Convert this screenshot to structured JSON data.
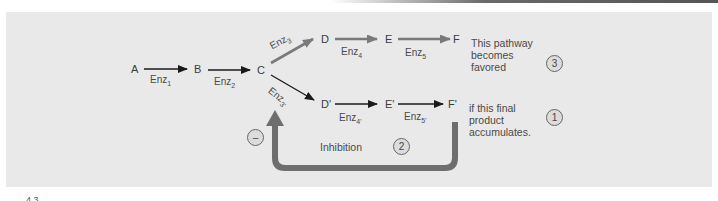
{
  "figure": {
    "caption_fragment": "4.3",
    "main_pathway": {
      "nodes": [
        "A",
        "B",
        "C"
      ],
      "enzymes": [
        {
          "label": "Enz",
          "sub": "1"
        },
        {
          "label": "Enz",
          "sub": "2"
        }
      ]
    },
    "upper_branch": {
      "nodes": [
        "D",
        "E",
        "F"
      ],
      "enzymes": [
        {
          "label": "Enz",
          "sub": "3"
        },
        {
          "label": "Enz",
          "sub": "4"
        },
        {
          "label": "Enz",
          "sub": "5"
        }
      ],
      "note_lines": [
        "This pathway",
        "becomes",
        "favored"
      ],
      "step_number": "3",
      "arrow_color": "#7a7a7a"
    },
    "lower_branch": {
      "nodes": [
        "D'",
        "E'",
        "F'"
      ],
      "enzymes": [
        {
          "label": "Enz",
          "sub": "3'"
        },
        {
          "label": "Enz",
          "sub": "4'"
        },
        {
          "label": "Enz",
          "sub": "5'"
        }
      ],
      "note_lines": [
        "if this final",
        "product",
        "accumulates."
      ],
      "step_number": "1",
      "arrow_color": "#1a1a1a"
    },
    "feedback": {
      "label": "Inhibition",
      "step_number": "2",
      "sign": "–",
      "arrow_color": "#6e6e6e"
    },
    "colors": {
      "panel_background": "#e9e9e9",
      "text": "#444444"
    }
  }
}
